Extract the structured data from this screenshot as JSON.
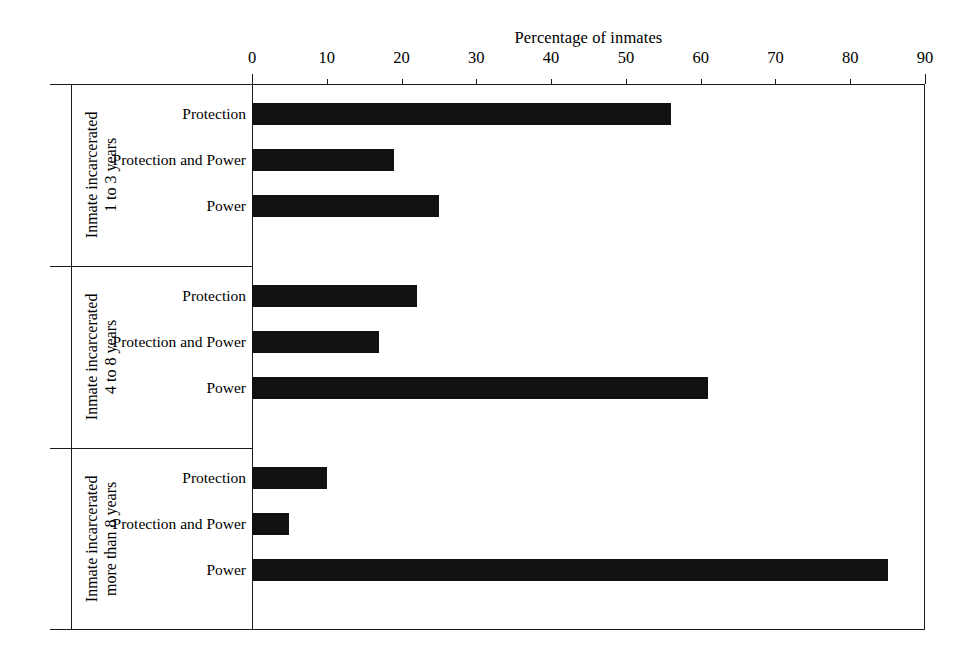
{
  "chart_data": {
    "type": "bar",
    "orientation": "horizontal",
    "title": "",
    "xlabel": "Percentage of inmates",
    "ylabel": "",
    "xlim": [
      0,
      90
    ],
    "xticks": [
      0,
      10,
      20,
      30,
      40,
      50,
      60,
      70,
      80,
      90
    ],
    "grid": false,
    "legend": false,
    "bar_color": "#111111",
    "categories": [
      "Protection",
      "Protection and Power",
      "Power"
    ],
    "groups": [
      {
        "name": "Inmate incarcerated\n1 to 3 years",
        "label_lines": [
          "Inmate incarcerated",
          "1 to 3 years"
        ],
        "values": [
          56,
          19,
          25
        ]
      },
      {
        "name": "Inmate incarcerated\n4 to 8 years",
        "label_lines": [
          "Inmate incarcerated",
          "4 to 8 years"
        ],
        "values": [
          22,
          17,
          61
        ]
      },
      {
        "name": "Inmate incarcerated\nmore than 8 years",
        "label_lines": [
          "Inmate incarcerated",
          "more than 8 years"
        ],
        "values": [
          10,
          5,
          85
        ]
      }
    ]
  },
  "axis": {
    "title": "Percentage of inmates",
    "tick_labels": [
      "0",
      "10",
      "20",
      "30",
      "40",
      "50",
      "60",
      "70",
      "80",
      "90"
    ]
  },
  "groups": [
    {
      "title_line1": "Inmate incarcerated",
      "title_line2": "1 to 3 years",
      "rows": [
        {
          "label": "Protection",
          "value": 56
        },
        {
          "label": "Protection and Power",
          "value": 19
        },
        {
          "label": "Power",
          "value": 25
        }
      ]
    },
    {
      "title_line1": "Inmate incarcerated",
      "title_line2": "4 to 8 years",
      "rows": [
        {
          "label": "Protection",
          "value": 22
        },
        {
          "label": "Protection and Power",
          "value": 17
        },
        {
          "label": "Power",
          "value": 61
        }
      ]
    },
    {
      "title_line1": "Inmate incarcerated",
      "title_line2": "more than 8 years",
      "rows": [
        {
          "label": "Protection",
          "value": 10
        },
        {
          "label": "Protection and Power",
          "value": 5
        },
        {
          "label": "Power",
          "value": 85
        }
      ]
    }
  ]
}
